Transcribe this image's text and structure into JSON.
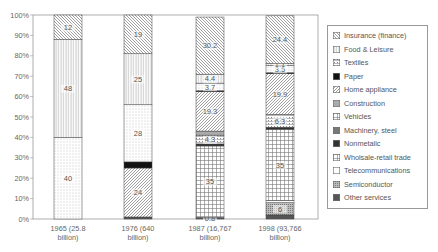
{
  "chart_data": {
    "type": "bar",
    "stacked": true,
    "percent": true,
    "title": "",
    "xlabel": "",
    "ylabel": "",
    "ylim": [
      0,
      100
    ],
    "yticks": [
      "0%",
      "10%",
      "20%",
      "30%",
      "40%",
      "50%",
      "60%",
      "70%",
      "80%",
      "90%",
      "100%"
    ],
    "grid": false,
    "legend_position": "right",
    "categories": [
      "1965 (25.8 billion)",
      "1976 (640 billion)",
      "1987 (16,767 billion)",
      "1998 (93,766 billion)"
    ],
    "category_lines": [
      [
        "1965 (25.8",
        "billion)"
      ],
      [
        "1976 (640",
        "billion)"
      ],
      [
        "1987 (16,767",
        "billion)"
      ],
      [
        "1998 (93,766",
        "billion)"
      ]
    ],
    "series": [
      {
        "name": "Other services",
        "pattern": "dark",
        "values": [
          0,
          1,
          0.8,
          2
        ],
        "labels": [
          "",
          "",
          "0.8",
          ""
        ]
      },
      {
        "name": "Semiconductor",
        "pattern": "densedots",
        "values": [
          0,
          0,
          0,
          6
        ],
        "labels": [
          "",
          "",
          "",
          "6"
        ]
      },
      {
        "name": "Telecommunications",
        "pattern": "blank",
        "values": [
          0,
          0,
          0,
          1
        ],
        "labels": [
          "",
          "",
          "",
          ""
        ]
      },
      {
        "name": "Wholsale-retail trade",
        "pattern": "grid",
        "values": [
          0,
          0,
          35,
          35
        ],
        "labels": [
          "",
          "",
          "35",
          "35"
        ]
      },
      {
        "name": "Nonmetalic",
        "pattern": "darkgray",
        "values": [
          0,
          0,
          1,
          1
        ],
        "labels": [
          "",
          "",
          "",
          ""
        ]
      },
      {
        "name": "Machinery, steel",
        "pattern": "midgray",
        "values": [
          0,
          0,
          0,
          0
        ],
        "labels": [
          "",
          "",
          "",
          ""
        ]
      },
      {
        "name": "Vehicles",
        "pattern": "crossdots",
        "values": [
          0,
          0,
          4.3,
          6.3
        ],
        "labels": [
          "",
          "",
          "4.3",
          "6.3"
        ]
      },
      {
        "name": "Construction",
        "pattern": "lightgray",
        "values": [
          0,
          0,
          2,
          0
        ],
        "labels": [
          "",
          "",
          "",
          ""
        ]
      },
      {
        "name": "Home appliance",
        "pattern": "diag-right",
        "values": [
          0,
          24,
          19.3,
          19.9
        ],
        "labels": [
          "",
          "24",
          "19.3",
          "19.9"
        ]
      },
      {
        "name": "Paper",
        "pattern": "black",
        "values": [
          0,
          3,
          0.5,
          0.5
        ],
        "labels": [
          "",
          "",
          "",
          ""
        ]
      },
      {
        "name": "Textiles",
        "pattern": "dots",
        "values": [
          40,
          28,
          3.7,
          3.5
        ],
        "labels": [
          "40",
          "28",
          "3.7",
          "3.5"
        ]
      },
      {
        "name": "Food & Leisure",
        "pattern": "vertical",
        "values": [
          48,
          25,
          4.4,
          1.1
        ],
        "labels": [
          "48",
          "25",
          "4.4",
          "1.1"
        ]
      },
      {
        "name": "Insurance (finance)",
        "pattern": "diag-left",
        "values": [
          12,
          19,
          28.0,
          23.3
        ],
        "labels": [
          "12",
          "19",
          "30.2",
          "24.4"
        ]
      }
    ],
    "legend": [
      {
        "name": "Insurance (finance)",
        "pattern": "diag-left"
      },
      {
        "name": "Food & Leisure",
        "pattern": "vertical"
      },
      {
        "name": "Textiles",
        "pattern": "crossdots"
      },
      {
        "name": "Paper",
        "pattern": "black"
      },
      {
        "name": "Home appliance",
        "pattern": "diag-right"
      },
      {
        "name": "Construction",
        "pattern": "lightgray"
      },
      {
        "name": "Vehicles",
        "pattern": "grid"
      },
      {
        "name": "Machinery, steel",
        "pattern": "midgray"
      },
      {
        "name": "Nonmetalic",
        "pattern": "darkgray"
      },
      {
        "name": "Wholsale-retail trade",
        "pattern": "grid"
      },
      {
        "name": "Telecommunications",
        "pattern": "blank"
      },
      {
        "name": "Semiconductor",
        "pattern": "densedots"
      },
      {
        "name": "Other services",
        "pattern": "dark"
      }
    ]
  }
}
